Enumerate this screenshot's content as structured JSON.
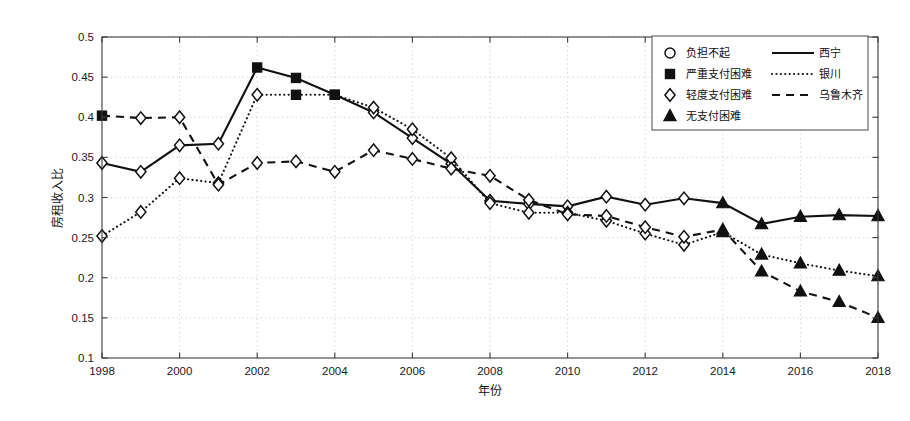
{
  "chart_data": {
    "type": "line",
    "title": "",
    "xlabel": "年份",
    "ylabel": "房租收入比",
    "xlim": [
      1998,
      2018
    ],
    "ylim": [
      0.1,
      0.5
    ],
    "grid": true,
    "x": [
      1998,
      1999,
      2000,
      2001,
      2002,
      2003,
      2004,
      2005,
      2006,
      2007,
      2008,
      2009,
      2010,
      2011,
      2012,
      2013,
      2014,
      2015,
      2016,
      2017,
      2018
    ],
    "xticks": [
      "1998",
      "2000",
      "2002",
      "2004",
      "2006",
      "2008",
      "2010",
      "2012",
      "2014",
      "2016",
      "2018"
    ],
    "xtick_values": [
      1998,
      2000,
      2002,
      2004,
      2006,
      2008,
      2010,
      2012,
      2014,
      2016,
      2018
    ],
    "yticks": [
      "0.1",
      "0.15",
      "0.2",
      "0.25",
      "0.3",
      "0.35",
      "0.4",
      "0.45",
      "0.5"
    ],
    "ytick_values": [
      0.1,
      0.15,
      0.2,
      0.25,
      0.3,
      0.35,
      0.4,
      0.45,
      0.5
    ],
    "legend_position": "top-right",
    "marker_legend": [
      {
        "marker": "circle-open",
        "label": "负担不起"
      },
      {
        "marker": "square-filled",
        "label": "严重支付困难"
      },
      {
        "marker": "diamond-open",
        "label": "轻度支付困难"
      },
      {
        "marker": "triangle-filled",
        "label": "无支付困难"
      }
    ],
    "line_legend": [
      {
        "style": "solid",
        "label": "西宁"
      },
      {
        "style": "dotted",
        "label": "银川"
      },
      {
        "style": "dashed",
        "label": "乌鲁木齐"
      }
    ],
    "series": [
      {
        "name": "西宁",
        "style": "solid",
        "values": [
          0.343,
          0.332,
          0.365,
          0.367,
          0.462,
          0.449,
          0.428,
          0.406,
          0.374,
          0.342,
          0.296,
          0.292,
          0.289,
          0.301,
          0.291,
          0.299,
          0.293,
          0.267,
          0.276,
          0.278,
          0.277
        ],
        "markers": [
          "diamond-open",
          "diamond-open",
          "diamond-open",
          "diamond-open",
          "square-filled",
          "square-filled",
          "square-filled",
          "diamond-open",
          "diamond-open",
          "diamond-open",
          "diamond-open",
          "diamond-open",
          "diamond-open",
          "diamond-open",
          "diamond-open",
          "diamond-open",
          "triangle-filled",
          "triangle-filled",
          "triangle-filled",
          "triangle-filled",
          "triangle-filled"
        ]
      },
      {
        "name": "银川",
        "style": "dotted",
        "values": [
          0.252,
          0.282,
          0.324,
          0.318,
          0.428,
          0.428,
          0.428,
          0.412,
          0.385,
          0.349,
          0.293,
          0.281,
          0.281,
          0.271,
          0.255,
          0.241,
          0.257,
          0.229,
          0.218,
          0.209,
          0.202
        ],
        "markers": [
          "diamond-open",
          "diamond-open",
          "diamond-open",
          "diamond-open",
          "diamond-open",
          "square-filled",
          "square-filled",
          "diamond-open",
          "diamond-open",
          "diamond-open",
          "diamond-open",
          "diamond-open",
          "diamond-open",
          "diamond-open",
          "diamond-open",
          "diamond-open",
          "triangle-filled",
          "triangle-filled",
          "triangle-filled",
          "triangle-filled",
          "triangle-filled"
        ]
      },
      {
        "name": "乌鲁木齐",
        "style": "dashed",
        "values": [
          0.402,
          0.399,
          0.4,
          0.316,
          0.343,
          0.345,
          0.332,
          0.359,
          0.348,
          0.336,
          0.327,
          0.297,
          0.279,
          0.277,
          0.263,
          0.251,
          0.26,
          0.208,
          0.183,
          0.17,
          0.15
        ],
        "markers": [
          "square-filled",
          "diamond-open",
          "diamond-open",
          "diamond-open",
          "diamond-open",
          "diamond-open",
          "diamond-open",
          "diamond-open",
          "diamond-open",
          "diamond-open",
          "diamond-open",
          "diamond-open",
          "diamond-open",
          "diamond-open",
          "diamond-open",
          "diamond-open",
          "triangle-filled",
          "triangle-filled",
          "triangle-filled",
          "triangle-filled",
          "triangle-filled"
        ]
      }
    ]
  },
  "figure": {
    "background_color": "#ffffff",
    "line_color": "#111111",
    "grid_color": "#b9b9b9"
  }
}
